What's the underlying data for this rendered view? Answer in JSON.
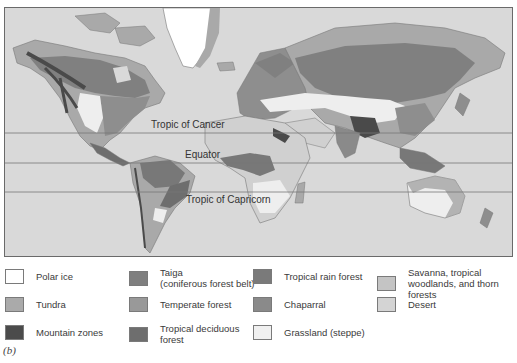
{
  "map": {
    "latitude_lines": [
      {
        "name": "tropic-of-cancer",
        "label": "Tropic of Cancer",
        "y": 125
      },
      {
        "name": "equator",
        "label": "Equator",
        "y": 155
      },
      {
        "name": "tropic-of-capricorn",
        "label": "Tropic of Capricorn",
        "y": 184
      }
    ],
    "colors": {
      "ocean": "#d9d9d9",
      "polar_ice": "#ffffff",
      "tundra": "#a9a9a9",
      "taiga": "#808080",
      "mountain": "#4a4a4a",
      "temperate_forest": "#999999",
      "tropical_deciduous": "#6e6e6e",
      "tropical_rain": "#787878",
      "chaparral": "#8a8a8a",
      "grassland": "#eeeeee",
      "savanna": "#c2c2c2",
      "desert": "#d0d0d0"
    }
  },
  "legend": {
    "items": [
      {
        "label": "Polar ice",
        "color": "#ffffff"
      },
      {
        "label": "Tundra",
        "color": "#aaaaaa"
      },
      {
        "label": "Mountain zones",
        "color": "#4b4b4b"
      },
      {
        "label": "Taiga\n(coniferous forest belt)",
        "line1": "Taiga",
        "line2": "(coniferous forest belt)",
        "color": "#7f7f7f"
      },
      {
        "label": "Temperate forest",
        "color": "#999999"
      },
      {
        "label": "Tropical deciduous forest",
        "line1": "Tropical deciduous",
        "line2": "forest",
        "color": "#6e6e6e"
      },
      {
        "label": "Tropical rain forest",
        "color": "#7a7a7a"
      },
      {
        "label": "Chaparral",
        "color": "#8a8a8a"
      },
      {
        "label": "Grassland (steppe)",
        "color": "#f0f0f0"
      },
      {
        "label": "Savanna, tropical woodlands, and thorn forests",
        "line1": "Savanna, tropical",
        "line2": "woodlands, and thorn forests",
        "color": "#c4c4c4"
      },
      {
        "label": "Desert",
        "color": "#d4d4d4"
      }
    ]
  },
  "caption": "(b)"
}
